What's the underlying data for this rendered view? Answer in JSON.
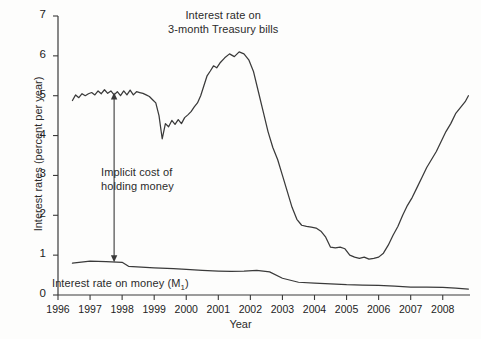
{
  "chart_data": {
    "type": "line",
    "title": "",
    "xlabel": "Year",
    "ylabel": "Interest rates (percent per year)",
    "xlim": [
      1996.0,
      2008.85
    ],
    "ylim": [
      0,
      7
    ],
    "ytick_values": [
      0,
      1,
      2,
      3,
      4,
      5,
      6,
      7
    ],
    "ytick_labels": [
      "0",
      "1",
      "2",
      "3",
      "4",
      "5",
      "6",
      "7"
    ],
    "xtick_values": [
      1996,
      1997,
      1998,
      1999,
      2000,
      2001,
      2002,
      2003,
      2004,
      2005,
      2006,
      2007,
      2008
    ],
    "xtick_labels": [
      "1996",
      "1997",
      "1998",
      "1999",
      "2000",
      "2001",
      "2002",
      "2003",
      "2004",
      "2005",
      "2006",
      "2007",
      "2008"
    ],
    "grid": false,
    "legend": "inline-annotations",
    "line_color": "#3a3a3a",
    "background_color": "#fdfdfc",
    "series": [
      {
        "name": "Interest rate on 3-month Treasury bills",
        "label_text_line1": "Interest rate on",
        "label_text_line2": "3-month Treasury bills",
        "x": [
          1996.45,
          1996.55,
          1996.65,
          1996.75,
          1996.85,
          1996.95,
          1997.05,
          1997.15,
          1997.25,
          1997.35,
          1997.45,
          1997.55,
          1997.65,
          1997.75,
          1997.85,
          1997.95,
          1998.05,
          1998.15,
          1998.25,
          1998.35,
          1998.45,
          1998.55,
          1998.65,
          1998.75,
          1998.85,
          1998.95,
          1999.05,
          1999.15,
          1999.25,
          1999.35,
          1999.45,
          1999.55,
          1999.65,
          1999.75,
          1999.85,
          1999.95,
          2000.05,
          2000.15,
          2000.25,
          2000.35,
          2000.45,
          2000.55,
          2000.65,
          2000.75,
          2000.85,
          2000.95,
          2001.05,
          2001.2,
          2001.35,
          2001.5,
          2001.65,
          2001.8,
          2001.95,
          2002.1,
          2002.25,
          2002.4,
          2002.55,
          2002.7,
          2002.85,
          2003.0,
          2003.15,
          2003.3,
          2003.45,
          2003.6,
          2003.75,
          2003.9,
          2004.05,
          2004.2,
          2004.35,
          2004.5,
          2004.65,
          2004.8,
          2004.95,
          2005.1,
          2005.25,
          2005.4,
          2005.55,
          2005.7,
          2005.85,
          2006.0,
          2006.15,
          2006.3,
          2006.45,
          2006.6,
          2006.75,
          2006.9,
          2007.05,
          2007.2,
          2007.35,
          2007.5,
          2007.65,
          2007.8,
          2007.95,
          2008.1,
          2008.25,
          2008.4,
          2008.55,
          2008.7,
          2008.8
        ],
        "y": [
          4.88,
          5.02,
          4.95,
          5.05,
          5.0,
          5.05,
          5.08,
          5.02,
          5.12,
          5.05,
          5.15,
          5.06,
          5.12,
          5.02,
          5.1,
          5.0,
          5.12,
          5.02,
          5.14,
          5.02,
          5.1,
          5.08,
          5.06,
          5.02,
          4.98,
          4.9,
          4.82,
          4.5,
          3.92,
          4.3,
          4.22,
          4.38,
          4.28,
          4.4,
          4.3,
          4.45,
          4.52,
          4.6,
          4.72,
          4.82,
          5.0,
          5.25,
          5.5,
          5.62,
          5.75,
          5.7,
          5.82,
          5.95,
          6.05,
          5.98,
          6.1,
          6.05,
          5.9,
          5.6,
          5.1,
          4.6,
          4.1,
          3.7,
          3.4,
          3.0,
          2.6,
          2.2,
          1.9,
          1.75,
          1.72,
          1.7,
          1.68,
          1.6,
          1.45,
          1.2,
          1.18,
          1.2,
          1.16,
          1.0,
          0.95,
          0.92,
          0.95,
          0.9,
          0.92,
          0.95,
          1.05,
          1.25,
          1.5,
          1.72,
          2.0,
          2.25,
          2.45,
          2.7,
          2.95,
          3.2,
          3.4,
          3.6,
          3.85,
          4.1,
          4.3,
          4.55,
          4.7,
          4.85,
          5.0
        ],
        "peak_value": 6.1,
        "peak_period": "late 2000",
        "trough_value": 0.9,
        "trough_period": "2003-2004",
        "final_value": 1.25
      },
      {
        "name": "Interest rate on money (M1)",
        "label_text": "Interest rate on money (M1)",
        "x": [
          1996.45,
          1997.0,
          1997.5,
          1998.0,
          1998.2,
          1998.6,
          1999.0,
          1999.6,
          2000.0,
          2000.5,
          2001.0,
          2001.4,
          2001.8,
          2002.2,
          2002.6,
          2003.0,
          2003.5,
          2004.0,
          2004.5,
          2005.0,
          2005.5,
          2006.0,
          2006.5,
          2007.0,
          2007.5,
          2008.0,
          2008.4,
          2008.8
        ],
        "y": [
          0.8,
          0.85,
          0.84,
          0.82,
          0.72,
          0.7,
          0.68,
          0.66,
          0.64,
          0.62,
          0.6,
          0.59,
          0.6,
          0.62,
          0.58,
          0.42,
          0.32,
          0.3,
          0.28,
          0.26,
          0.25,
          0.24,
          0.22,
          0.2,
          0.2,
          0.19,
          0.17,
          0.15
        ],
        "start_value": 0.8,
        "end_value": 0.15
      }
    ],
    "annotations": [
      {
        "name": "implicit-cost-arrow",
        "text_line1": "Implicit cost of",
        "text_line2": "holding money",
        "x_position": 1997.75,
        "y_top": 5.08,
        "y_bottom": 0.82,
        "style": "double-headed-vertical-arrow"
      }
    ]
  },
  "labels": {
    "y_axis_title": "Interest rates (percent per year)",
    "x_axis_title": "Year",
    "tbill_line1": "Interest rate on",
    "tbill_line2": "3-month Treasury bills",
    "implicit_line1": "Implicit cost of",
    "implicit_line2": "holding money",
    "m1_prefix": "Interest rate on money (M",
    "m1_subscript": "1",
    "m1_suffix": ")"
  }
}
